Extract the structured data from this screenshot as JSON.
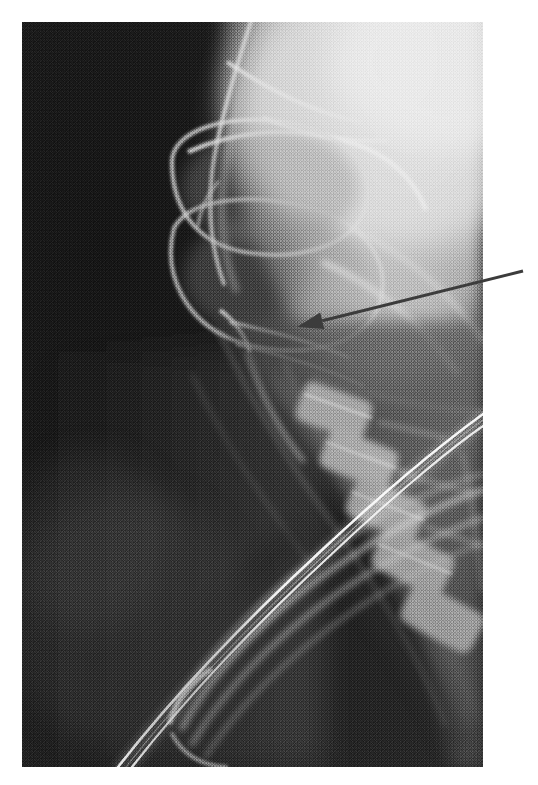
{
  "figure": {
    "kind": "radiograph",
    "modality_label": "X-ray",
    "view": "lateral",
    "region": "skull base and cervical spine",
    "caption": "",
    "frame": {
      "x": 22,
      "y": 22,
      "width": 461,
      "height": 745,
      "page_width": 538,
      "page_height": 785,
      "background_color": "#ffffff",
      "border_color": "#9a9a9a"
    },
    "tones": {
      "air_background": "#181818",
      "soft_tissue_dark": "#3a3a3a",
      "soft_tissue_mid": "#6d6d6d",
      "bone_mid": "#9a9a9a",
      "bone_bright": "#c9c9c9",
      "bone_brightest": "#e8e8e8",
      "tube_highlight": "#f2f2f2"
    },
    "annotation": {
      "type": "arrow",
      "label": "",
      "color": "#3c3c3c",
      "stroke_width": 3,
      "tail": {
        "x": 523,
        "y": 271
      },
      "tip": {
        "x": 297,
        "y": 327
      },
      "head_length": 26,
      "head_width": 17,
      "points_to": "skull base / clivus region"
    },
    "structures": [
      {
        "name": "calvarium",
        "tone": "bone_brightest"
      },
      {
        "name": "frontal-sinus",
        "tone": "soft_tissue_mid"
      },
      {
        "name": "orbital-roof",
        "tone": "bone_bright"
      },
      {
        "name": "sphenoid-sinus",
        "tone": "soft_tissue_mid"
      },
      {
        "name": "maxilla",
        "tone": "bone_mid"
      },
      {
        "name": "mandible-ramus",
        "tone": "bone_mid"
      },
      {
        "name": "cervical-vertebrae",
        "tone": "bone_mid"
      },
      {
        "name": "endotracheal-tube",
        "tone": "tube_highlight"
      },
      {
        "name": "tracheal-air-column",
        "tone": "soft_tissue_dark"
      }
    ]
  }
}
